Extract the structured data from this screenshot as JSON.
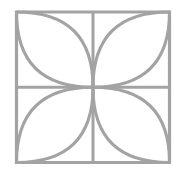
{
  "figure": {
    "name": "four-petal-square-tile",
    "background_color": "#ffffff",
    "stroke_color": "#a3a3a3",
    "stroke_width": 3,
    "stroke_width_border": 3.2,
    "canvas": {
      "width": 185,
      "height": 176
    }
  },
  "geometry": {
    "square": {
      "name": "outer-square",
      "left": 16.5,
      "top": 12,
      "right": 169.5,
      "bottom": 162.5,
      "width": 153,
      "height": 150.5
    },
    "center": {
      "x": 93,
      "y": 87.25
    },
    "midlines": {
      "vertical_x": 93,
      "horizontal_y": 87.25
    },
    "quadrants": [
      {
        "name": "petal-top-left",
        "corner": {
          "x": 16.5,
          "y": 12
        },
        "center": {
          "x": 93,
          "y": 87.25
        }
      },
      {
        "name": "petal-top-right",
        "corner": {
          "x": 169.5,
          "y": 12
        },
        "center": {
          "x": 93,
          "y": 87.25
        }
      },
      {
        "name": "petal-bottom-right",
        "corner": {
          "x": 169.5,
          "y": 162.5
        },
        "center": {
          "x": 93,
          "y": 87.25
        }
      },
      {
        "name": "petal-bottom-left",
        "corner": {
          "x": 16.5,
          "y": 162.5
        },
        "center": {
          "x": 93,
          "y": 87.25
        }
      }
    ],
    "petal_bulge": 0.56
  },
  "paths": {
    "square_outline": "M 16.5 12 L 169.5 12 L 169.5 162.5 L 16.5 162.5 Z",
    "midline_vertical": "M 93 12 L 93 162.5",
    "midline_horizontal": "M 16.5 87.25 L 169.5 87.25",
    "petal_top_left_arc_a": "M 16.5 12 Q 16.5 87.25 93 87.25",
    "petal_top_left_arc_b": "M 16.5 12 Q 93 12 93 87.25",
    "petal_top_right_arc_a": "M 169.5 12 Q 169.5 87.25 93 87.25",
    "petal_top_right_arc_b": "M 169.5 12 Q 93 12 93 87.25",
    "petal_bottom_right_arc_a": "M 169.5 162.5 Q 169.5 87.25 93 87.25",
    "petal_bottom_right_arc_b": "M 169.5 162.5 Q 93 162.5 93 87.25",
    "petal_bottom_left_arc_a": "M 16.5 162.5 Q 16.5 87.25 93 87.25",
    "petal_bottom_left_arc_b": "M 16.5 162.5 Q 93 162.5 93 87.25"
  }
}
